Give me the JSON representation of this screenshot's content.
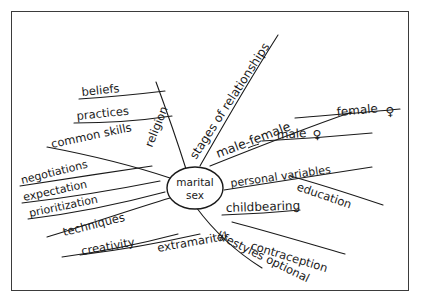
{
  "diagram": {
    "kind": "hand-drawn-mind-map",
    "ink_color": "#1a1a1a",
    "background_color": "#ffffff",
    "frame_color": "#3b3b3b",
    "center": {
      "label_line1": "marital",
      "label_line2": "sex"
    },
    "branches": [
      {
        "id": "religion",
        "label": "religion"
      },
      {
        "id": "beliefs",
        "label": "beliefs"
      },
      {
        "id": "practices",
        "label": "practices"
      },
      {
        "id": "common-skills",
        "label": "common skills"
      },
      {
        "id": "negotiations",
        "label": "negotiations"
      },
      {
        "id": "expectation",
        "label": "expectation"
      },
      {
        "id": "prioritization",
        "label": "prioritization"
      },
      {
        "id": "techniques",
        "label": "techniques"
      },
      {
        "id": "creativity",
        "label": "creativity"
      },
      {
        "id": "extramarital",
        "label": "extramarital"
      },
      {
        "id": "lifestyles-optional",
        "label": "lifestyles optional"
      },
      {
        "id": "contraception",
        "label": "contraception"
      },
      {
        "id": "childbearing",
        "label": "childbearing"
      },
      {
        "id": "personal-variables",
        "label": "personal variables"
      },
      {
        "id": "education",
        "label": "education"
      },
      {
        "id": "male-female",
        "label": "male-female"
      },
      {
        "id": "female",
        "label": "female"
      },
      {
        "id": "female-symbol",
        "label": "♀"
      },
      {
        "id": "male",
        "label": "male"
      },
      {
        "id": "male-symbol",
        "label": "♀"
      },
      {
        "id": "stages-of-relationships",
        "label": "stages of relationships"
      }
    ]
  }
}
